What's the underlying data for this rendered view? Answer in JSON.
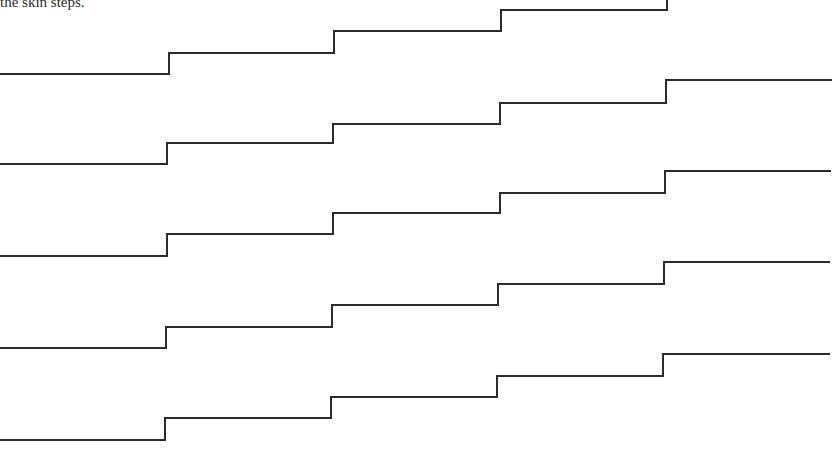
{
  "document": {
    "caption_fragment": "the skin steps."
  },
  "figure": {
    "type": "staircase-lines",
    "stroke_color": "#2b2b2b",
    "lines": [
      {
        "name": "step-line-1",
        "points": [
          [
            0,
            74
          ],
          [
            169,
            74
          ],
          [
            169,
            53
          ],
          [
            334,
            53
          ],
          [
            334,
            31
          ],
          [
            501,
            31
          ],
          [
            501,
            10
          ],
          [
            667,
            10
          ],
          [
            667,
            0
          ]
        ]
      },
      {
        "name": "step-line-2",
        "points": [
          [
            0,
            164
          ],
          [
            167,
            164
          ],
          [
            167,
            143
          ],
          [
            333,
            143
          ],
          [
            333,
            124
          ],
          [
            500,
            124
          ],
          [
            500,
            103
          ],
          [
            666,
            103
          ],
          [
            666,
            80
          ],
          [
            832,
            80
          ]
        ]
      },
      {
        "name": "step-line-3",
        "points": [
          [
            0,
            256
          ],
          [
            167,
            256
          ],
          [
            167,
            234
          ],
          [
            333,
            234
          ],
          [
            333,
            213
          ],
          [
            500,
            213
          ],
          [
            500,
            193
          ],
          [
            665,
            193
          ],
          [
            665,
            171
          ],
          [
            831,
            171
          ]
        ]
      },
      {
        "name": "step-line-4",
        "points": [
          [
            0,
            348
          ],
          [
            166,
            348
          ],
          [
            166,
            327
          ],
          [
            332,
            327
          ],
          [
            332,
            305
          ],
          [
            498,
            305
          ],
          [
            498,
            284
          ],
          [
            664,
            284
          ],
          [
            664,
            262
          ],
          [
            830,
            262
          ]
        ]
      },
      {
        "name": "step-line-5",
        "points": [
          [
            0,
            440
          ],
          [
            165,
            440
          ],
          [
            165,
            418
          ],
          [
            331,
            418
          ],
          [
            331,
            397
          ],
          [
            497,
            397
          ],
          [
            497,
            376
          ],
          [
            663,
            376
          ],
          [
            663,
            354
          ],
          [
            830,
            354
          ]
        ]
      }
    ]
  }
}
